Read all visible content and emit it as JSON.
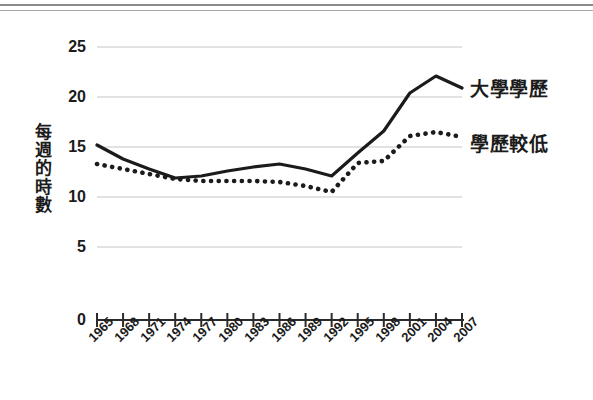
{
  "page": {
    "top_rules": [
      "page-rule-upper",
      "page-rule-lower"
    ]
  },
  "axis": {
    "y_title_chars": [
      "每",
      "週",
      "的",
      "時",
      "數"
    ],
    "y_ticks": [
      "0",
      "5",
      "10",
      "15",
      "20",
      "25"
    ],
    "x_ticks": [
      "1965",
      "1968",
      "1971",
      "1974",
      "1977",
      "1980",
      "1983",
      "1986",
      "1989",
      "1992",
      "1995",
      "1998",
      "2001",
      "2004",
      "2007"
    ]
  },
  "legend": {
    "college_label": "大學學歷",
    "lesser_label": "學歷較低"
  },
  "colors": {
    "line": "#1b1b1b",
    "gridline": "#d8d8d8",
    "axis": "#2b2b2b",
    "text": "#1b1b1b",
    "background": "#ffffff"
  },
  "chart_data": {
    "type": "line",
    "title": "",
    "subtitle": "",
    "xlabel": "",
    "ylabel": "每週的時數",
    "ylim": [
      0,
      25
    ],
    "yticks": [
      0,
      5,
      10,
      15,
      20,
      25
    ],
    "grid": "horizontal",
    "legend_position": "right",
    "x": [
      "1965",
      "1968",
      "1971",
      "1974",
      "1977",
      "1980",
      "1983",
      "1986",
      "1989",
      "1992",
      "1995",
      "1998",
      "2001",
      "2004",
      "2007"
    ],
    "series": [
      {
        "name": "大學學歷",
        "style": "solid",
        "color": "#1b1b1b",
        "values": [
          15.2,
          13.8,
          12.8,
          11.9,
          12.1,
          12.6,
          13.0,
          13.3,
          12.8,
          12.1,
          14.4,
          16.6,
          20.4,
          22.1,
          20.9
        ]
      },
      {
        "name": "學歷較低",
        "style": "dotted",
        "color": "#1b1b1b",
        "values": [
          13.3,
          12.8,
          12.3,
          11.8,
          11.6,
          11.6,
          11.6,
          11.5,
          11.1,
          10.5,
          13.4,
          13.6,
          16.1,
          16.5,
          16.0
        ]
      }
    ]
  }
}
